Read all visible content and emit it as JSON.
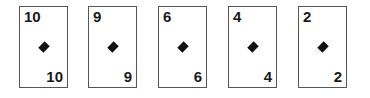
{
  "suit": "diamond",
  "cards": [
    {
      "rank": "10",
      "left": 19
    },
    {
      "rank": "9",
      "left": 88
    },
    {
      "rank": "6",
      "left": 158
    },
    {
      "rank": "4",
      "left": 228
    },
    {
      "rank": "2",
      "left": 298
    }
  ]
}
